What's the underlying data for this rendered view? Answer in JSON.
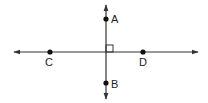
{
  "diagram": {
    "type": "perpendicular-lines",
    "colors": {
      "line": "#333333",
      "point": "#111111",
      "background": "#ffffff"
    },
    "lines": [
      {
        "name": "vertical-line-AB",
        "x1": 106,
        "y1": 5,
        "x2": 106,
        "y2": 99,
        "arrows": "both"
      },
      {
        "name": "horizontal-line-CD",
        "x1": 14,
        "y1": 52,
        "x2": 198,
        "y2": 52,
        "arrows": "both"
      }
    ],
    "right_angle_marker": {
      "x": 106,
      "y": 45,
      "size": 7
    },
    "points": [
      {
        "label": "A",
        "x": 106,
        "y": 19,
        "label_x": 111,
        "label_y": 23
      },
      {
        "label": "B",
        "x": 106,
        "y": 83,
        "label_x": 111,
        "label_y": 88
      },
      {
        "label": "C",
        "x": 50,
        "y": 52,
        "label_x": 45,
        "label_y": 66
      },
      {
        "label": "D",
        "x": 143,
        "y": 52,
        "label_x": 139,
        "label_y": 66
      }
    ]
  }
}
